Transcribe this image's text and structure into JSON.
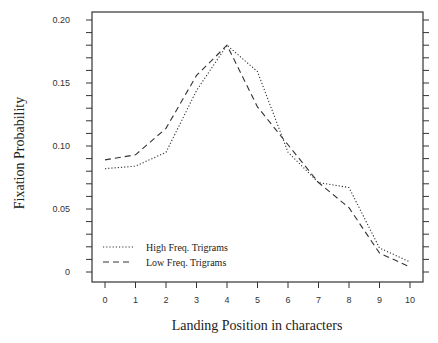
{
  "chart_data": {
    "type": "line",
    "title": "",
    "xlabel": "Landing Position in characters",
    "ylabel": "Fixation Probability",
    "x": [
      0,
      1,
      2,
      3,
      4,
      5,
      6,
      7,
      8,
      9,
      10
    ],
    "x_ticks": [
      "0",
      "1",
      "2",
      "3",
      "4",
      "5",
      "6",
      "7",
      "8",
      "9",
      "10"
    ],
    "y_ticks": [
      "0",
      "0.05",
      "0.10",
      "0.15",
      "0.20"
    ],
    "y_tick_values": [
      0,
      0.05,
      0.1,
      0.15,
      0.2
    ],
    "ylim": [
      0,
      0.2
    ],
    "xlim": [
      0,
      10
    ],
    "grid": false,
    "legend_position": "lower left",
    "series": [
      {
        "name": "High Freq. Trigrams",
        "style": "dotted",
        "values": [
          0.082,
          0.084,
          0.095,
          0.144,
          0.18,
          0.159,
          0.095,
          0.071,
          0.067,
          0.019,
          0.008
        ]
      },
      {
        "name": "Low Freq. Trigrams",
        "style": "dashed",
        "values": [
          0.089,
          0.093,
          0.114,
          0.156,
          0.18,
          0.131,
          0.101,
          0.071,
          0.051,
          0.015,
          0.004
        ]
      }
    ]
  }
}
